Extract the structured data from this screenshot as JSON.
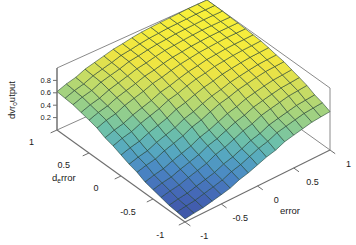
{
  "figure": {
    "type": "surface-plot-3d",
    "background": "#ffffff",
    "edge_color": "#1c3a2e",
    "axis_line_color": "#8a8a8a"
  },
  "axes": {
    "x": {
      "label": "error",
      "ticks": [
        "-1",
        "-0.5",
        "0",
        "0.5",
        "1"
      ],
      "tick_values": [
        -1,
        -0.5,
        0,
        0.5,
        1
      ],
      "range": [
        -1,
        1
      ]
    },
    "y": {
      "label_main": "d",
      "label_sub": "e",
      "label_tail": "rror",
      "label_full": "d_error",
      "ticks": [
        "-1",
        "-0.5",
        "0",
        "0.5",
        "1"
      ],
      "tick_values": [
        -1,
        -0.5,
        0,
        0.5,
        1
      ],
      "range": [
        -1,
        1
      ]
    },
    "z": {
      "label_main": "dvr",
      "label_sub": "o",
      "label_tail": "utput",
      "label_full": "dvr_output",
      "ticks": [
        "0.8",
        "0.6",
        "0.4",
        "0.2"
      ],
      "tick_values": [
        0.8,
        0.6,
        0.4,
        0.2
      ],
      "range": [
        0,
        1
      ]
    }
  },
  "colormap": {
    "name": "parula-like",
    "stops": [
      "#3b4a9c",
      "#4464b4",
      "#4a86c4",
      "#56a8c0",
      "#6fc2a8",
      "#9fd183",
      "#cadd62",
      "#eee443",
      "#f7ef3a"
    ]
  },
  "chart_data": {
    "type": "surface",
    "title": "",
    "xlabel": "error",
    "ylabel": "d_error",
    "zlabel": "dvr_output",
    "xlim": [
      -1,
      1
    ],
    "ylim": [
      -1,
      1
    ],
    "zlim": [
      0,
      1
    ],
    "grid": true,
    "legend": "none",
    "x": [
      -1,
      -0.8,
      -0.6,
      -0.4,
      -0.2,
      0,
      0.2,
      0.4,
      0.6,
      0.8,
      1
    ],
    "y": [
      -1,
      -0.8,
      -0.6,
      -0.4,
      -0.2,
      0,
      0.2,
      0.4,
      0.6,
      0.8,
      1
    ],
    "z_description": "dvr_output rises monotonically with both error and d_error; low plateau near (-1,-1), high plateau near (+1,+1)",
    "z": [
      [
        0.05,
        0.08,
        0.12,
        0.18,
        0.26,
        0.34,
        0.42,
        0.5,
        0.56,
        0.6,
        0.62
      ],
      [
        0.08,
        0.12,
        0.17,
        0.24,
        0.32,
        0.41,
        0.5,
        0.58,
        0.64,
        0.68,
        0.7
      ],
      [
        0.12,
        0.17,
        0.23,
        0.31,
        0.4,
        0.49,
        0.58,
        0.66,
        0.72,
        0.76,
        0.78
      ],
      [
        0.18,
        0.24,
        0.31,
        0.4,
        0.49,
        0.58,
        0.67,
        0.74,
        0.8,
        0.83,
        0.85
      ],
      [
        0.26,
        0.32,
        0.4,
        0.49,
        0.58,
        0.67,
        0.75,
        0.81,
        0.86,
        0.89,
        0.9
      ],
      [
        0.34,
        0.41,
        0.49,
        0.58,
        0.67,
        0.75,
        0.82,
        0.87,
        0.91,
        0.93,
        0.94
      ],
      [
        0.42,
        0.5,
        0.58,
        0.67,
        0.75,
        0.82,
        0.88,
        0.92,
        0.95,
        0.96,
        0.97
      ],
      [
        0.5,
        0.58,
        0.66,
        0.74,
        0.81,
        0.87,
        0.92,
        0.95,
        0.97,
        0.98,
        0.98
      ],
      [
        0.56,
        0.64,
        0.72,
        0.8,
        0.86,
        0.91,
        0.95,
        0.97,
        0.99,
        0.99,
        0.99
      ],
      [
        0.6,
        0.68,
        0.76,
        0.83,
        0.89,
        0.93,
        0.96,
        0.98,
        0.99,
        1.0,
        1.0
      ],
      [
        0.62,
        0.7,
        0.78,
        0.85,
        0.9,
        0.94,
        0.97,
        0.98,
        0.99,
        1.0,
        1.0
      ]
    ]
  }
}
